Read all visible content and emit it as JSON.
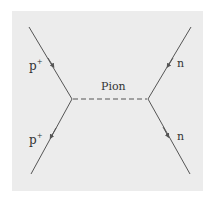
{
  "diagram": {
    "mediator_label": "Pion",
    "left_in_label": "p",
    "left_in_sup": "+",
    "left_out_label": "p",
    "left_out_sup": "+",
    "right_in_label": "n",
    "right_out_label": "n",
    "colors": {
      "background": "#ececec",
      "line": "#555555",
      "text": "#333333"
    }
  }
}
